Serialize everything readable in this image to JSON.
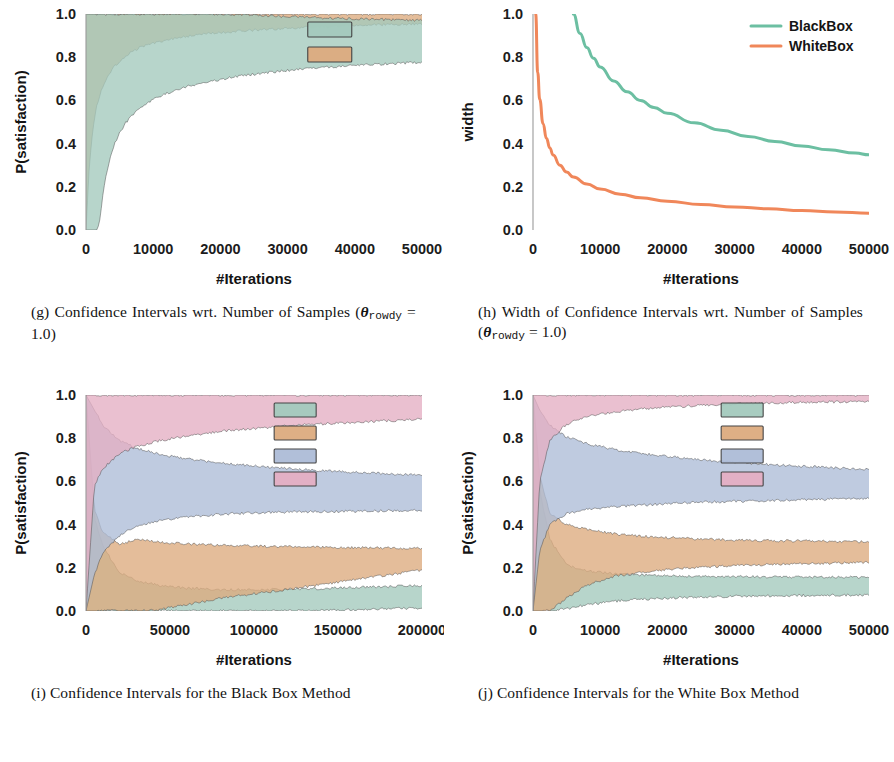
{
  "figure": {
    "panels": [
      {
        "key": "g",
        "tag": "(g)",
        "caption_line1": "Confidence Intervals wrt. Number of",
        "caption_line2_pre": "Samples (",
        "caption_theta": "θ",
        "caption_sub": "rowdy",
        "caption_line2_post": " = 1.0)",
        "chart_ref": 0
      },
      {
        "key": "h",
        "tag": "(h)",
        "caption_line1": "Width of Confidence Intervals wrt.",
        "caption_line2_pre": "Number of Samples (",
        "caption_theta": "θ",
        "caption_sub": "rowdy",
        "caption_line2_post": " = 1.0)",
        "chart_ref": 1
      },
      {
        "key": "i",
        "tag": "(i)",
        "caption_line1": "Confidence Intervals for the Black",
        "caption_line2_pre": "Box Method",
        "caption_theta": "",
        "caption_sub": "",
        "caption_line2_post": "",
        "chart_ref": 2
      },
      {
        "key": "j",
        "tag": "(j)",
        "caption_line1": "Confidence Intervals for the White",
        "caption_line2_pre": "Box Method",
        "caption_theta": "",
        "caption_sub": "",
        "caption_line2_post": "",
        "chart_ref": 3
      }
    ]
  },
  "colors": {
    "green_band": "#a3c9bd",
    "orange_band": "#dcab7e",
    "blue_band": "#adbcd7",
    "pink_band": "#e4aec3",
    "green_line": "#6cbfa2",
    "orange_line": "#f0875a",
    "edge": "#4d4d4d",
    "spine": "#9a9a9a",
    "text": "#1a1a1a"
  },
  "chart_data": [
    {
      "type": "area",
      "title": "",
      "xlabel": "#Iterations",
      "ylabel": "P(satisfaction)",
      "xlim": [
        0,
        50000
      ],
      "ylim": [
        0.0,
        1.0
      ],
      "xticks": [
        0,
        10000,
        20000,
        30000,
        40000,
        50000
      ],
      "xticklabels": [
        "0",
        "10000",
        "20000",
        "30000",
        "40000",
        "50000"
      ],
      "yticks": [
        0.0,
        0.2,
        0.4,
        0.6,
        0.8,
        1.0
      ],
      "yticklabels": [
        "0.0",
        "0.2",
        "0.4",
        "0.6",
        "0.8",
        "1.0"
      ],
      "grid": false,
      "legend_position": "upper-right-inside",
      "legend_entries": [
        {
          "label": "",
          "color": "#a3c9bd",
          "swatch": "box"
        },
        {
          "label": "",
          "color": "#dcab7e",
          "swatch": "box"
        }
      ],
      "series": [
        {
          "name": "WhiteBox interval",
          "color": "#dcab7e",
          "x": [
            0,
            500,
            1000,
            1500,
            2000,
            3000,
            4000,
            6000,
            8000,
            10000,
            14000,
            18000,
            22000,
            26000,
            30000,
            35000,
            40000,
            45000,
            50000
          ],
          "lower": [
            0.0,
            0.3,
            0.46,
            0.56,
            0.62,
            0.7,
            0.75,
            0.81,
            0.845,
            0.865,
            0.893,
            0.908,
            0.919,
            0.927,
            0.934,
            0.941,
            0.947,
            0.951,
            0.955
          ],
          "upper": [
            1.0,
            1.0,
            1.0,
            1.0,
            1.0,
            1.0,
            1.0,
            1.0,
            1.0,
            1.0,
            1.0,
            1.0,
            1.0,
            1.0,
            1.0,
            1.0,
            1.0,
            1.0,
            1.0
          ]
        },
        {
          "name": "BlackBox interval",
          "color": "#a3c9bd",
          "x": [
            0,
            1000,
            1500,
            2000,
            2500,
            3000,
            4000,
            5000,
            6000,
            8000,
            10000,
            13000,
            16000,
            20000,
            25000,
            30000,
            35000,
            40000,
            45000,
            50000
          ],
          "lower": [
            0.0,
            0.0,
            0.0,
            0.03,
            0.16,
            0.26,
            0.38,
            0.45,
            0.5,
            0.565,
            0.605,
            0.645,
            0.672,
            0.697,
            0.722,
            0.739,
            0.752,
            0.761,
            0.77,
            0.777
          ],
          "upper": [
            1.0,
            1.0,
            1.0,
            1.0,
            1.0,
            1.0,
            1.0,
            1.0,
            1.0,
            1.0,
            1.0,
            1.0,
            1.0,
            1.0,
            0.995,
            0.988,
            0.982,
            0.978,
            0.974,
            0.97
          ]
        }
      ]
    },
    {
      "type": "line",
      "title": "",
      "xlabel": "#Iterations",
      "ylabel": "width",
      "xlim": [
        0,
        50000
      ],
      "ylim": [
        0.0,
        1.0
      ],
      "xticks": [
        0,
        10000,
        20000,
        30000,
        40000,
        50000
      ],
      "xticklabels": [
        "0",
        "10000",
        "20000",
        "30000",
        "40000",
        "50000"
      ],
      "yticks": [
        0.0,
        0.2,
        0.4,
        0.6,
        0.8,
        1.0
      ],
      "yticklabels": [
        "0.0",
        "0.2",
        "0.4",
        "0.6",
        "0.8",
        "1.0"
      ],
      "grid": false,
      "legend_position": "upper-right",
      "legend_entries": [
        {
          "label": "BlackBox",
          "color": "#6cbfa2",
          "swatch": "line"
        },
        {
          "label": "WhiteBox",
          "color": "#f0875a",
          "swatch": "line"
        }
      ],
      "series": [
        {
          "name": "BlackBox",
          "color": "#6cbfa2",
          "x": [
            6000,
            7000,
            8000,
            9000,
            10000,
            12000,
            14000,
            16000,
            18000,
            20000,
            24000,
            28000,
            32000,
            36000,
            40000,
            44000,
            48000,
            50000
          ],
          "y": [
            1.0,
            0.91,
            0.845,
            0.795,
            0.755,
            0.69,
            0.64,
            0.6,
            0.567,
            0.54,
            0.496,
            0.462,
            0.433,
            0.41,
            0.389,
            0.371,
            0.356,
            0.348
          ]
        },
        {
          "name": "WhiteBox",
          "color": "#f0875a",
          "x": [
            400,
            700,
            1000,
            1500,
            2000,
            2500,
            3000,
            4000,
            5000,
            6000,
            8000,
            10000,
            13000,
            16000,
            20000,
            25000,
            30000,
            35000,
            40000,
            45000,
            50000
          ],
          "y": [
            1.0,
            0.73,
            0.605,
            0.492,
            0.425,
            0.38,
            0.347,
            0.3,
            0.268,
            0.245,
            0.213,
            0.19,
            0.166,
            0.149,
            0.133,
            0.118,
            0.107,
            0.098,
            0.09,
            0.083,
            0.078
          ]
        }
      ]
    },
    {
      "type": "area",
      "title": "",
      "xlabel": "#Iterations",
      "ylabel": "P(satisfaction)",
      "xlim": [
        0,
        200000
      ],
      "ylim": [
        0.0,
        1.0
      ],
      "xticks": [
        0,
        50000,
        100000,
        150000,
        200000
      ],
      "xticklabels": [
        "0",
        "50000",
        "100000",
        "150000",
        "200000"
      ],
      "yticks": [
        0.0,
        0.2,
        0.4,
        0.6,
        0.8,
        1.0
      ],
      "yticklabels": [
        "0.0",
        "0.2",
        "0.4",
        "0.6",
        "0.8",
        "1.0"
      ],
      "grid": false,
      "legend_position": "upper-center",
      "legend_entries": [
        {
          "label": "",
          "color": "#a3c9bd",
          "swatch": "box"
        },
        {
          "label": "",
          "color": "#dcab7e",
          "swatch": "box"
        },
        {
          "label": "",
          "color": "#adbcd7",
          "swatch": "box"
        },
        {
          "label": "",
          "color": "#e4aec3",
          "swatch": "box"
        }
      ],
      "series": [
        {
          "name": "interval-green",
          "color": "#a3c9bd",
          "x": [
            0,
            5000,
            10000,
            20000,
            30000,
            45000,
            60000,
            80000,
            100000,
            120000,
            140000,
            160000,
            180000,
            200000
          ],
          "lower": [
            0.0,
            0.0,
            0.0,
            0.0,
            0.0,
            0.0,
            0.0,
            0.0,
            0.0,
            0.0,
            0.002,
            0.005,
            0.01,
            0.015
          ],
          "upper": [
            1.0,
            0.43,
            0.3,
            0.18,
            0.14,
            0.118,
            0.106,
            0.098,
            0.098,
            0.1,
            0.104,
            0.109,
            0.113,
            0.118
          ]
        },
        {
          "name": "interval-orange",
          "color": "#dcab7e",
          "x": [
            0,
            5000,
            10000,
            20000,
            30000,
            45000,
            60000,
            80000,
            100000,
            120000,
            140000,
            160000,
            180000,
            200000
          ],
          "lower": [
            0.0,
            0.0,
            0.0,
            0.0,
            0.0,
            0.008,
            0.03,
            0.058,
            0.08,
            0.1,
            0.122,
            0.145,
            0.168,
            0.19
          ],
          "upper": [
            1.0,
            0.47,
            0.365,
            0.31,
            0.33,
            0.318,
            0.31,
            0.305,
            0.3,
            0.298,
            0.295,
            0.293,
            0.292,
            0.29
          ]
        },
        {
          "name": "interval-blue",
          "color": "#adbcd7",
          "x": [
            0,
            5000,
            10000,
            20000,
            30000,
            45000,
            60000,
            80000,
            100000,
            120000,
            140000,
            160000,
            180000,
            200000
          ],
          "lower": [
            0.0,
            0.17,
            0.27,
            0.35,
            0.395,
            0.42,
            0.435,
            0.448,
            0.455,
            0.458,
            0.46,
            0.462,
            0.464,
            0.465
          ],
          "upper": [
            1.0,
            0.93,
            0.86,
            0.79,
            0.752,
            0.725,
            0.705,
            0.685,
            0.672,
            0.66,
            0.65,
            0.642,
            0.635,
            0.628
          ]
        },
        {
          "name": "interval-pink",
          "color": "#e4aec3",
          "x": [
            0,
            5000,
            10000,
            20000,
            30000,
            45000,
            60000,
            80000,
            100000,
            120000,
            140000,
            160000,
            180000,
            200000
          ],
          "lower": [
            0.0,
            0.58,
            0.66,
            0.728,
            0.762,
            0.79,
            0.81,
            0.832,
            0.845,
            0.857,
            0.866,
            0.874,
            0.881,
            0.888
          ],
          "upper": [
            1.0,
            1.0,
            1.0,
            1.0,
            1.0,
            1.0,
            1.0,
            1.0,
            1.0,
            1.0,
            1.0,
            1.0,
            1.0,
            1.0
          ]
        }
      ]
    },
    {
      "type": "area",
      "title": "",
      "xlabel": "#Iterations",
      "ylabel": "P(satisfaction)",
      "xlim": [
        0,
        50000
      ],
      "ylim": [
        0.0,
        1.0
      ],
      "xticks": [
        0,
        10000,
        20000,
        30000,
        40000,
        50000
      ],
      "xticklabels": [
        "0",
        "10000",
        "20000",
        "30000",
        "40000",
        "50000"
      ],
      "yticks": [
        0.0,
        0.2,
        0.4,
        0.6,
        0.8,
        1.0
      ],
      "yticklabels": [
        "0.0",
        "0.2",
        "0.4",
        "0.6",
        "0.8",
        "1.0"
      ],
      "grid": false,
      "legend_position": "upper-center",
      "legend_entries": [
        {
          "label": "",
          "color": "#a3c9bd",
          "swatch": "box"
        },
        {
          "label": "",
          "color": "#dcab7e",
          "swatch": "box"
        },
        {
          "label": "",
          "color": "#adbcd7",
          "swatch": "box"
        },
        {
          "label": "",
          "color": "#e4aec3",
          "swatch": "box"
        }
      ],
      "series": [
        {
          "name": "interval-green",
          "color": "#a3c9bd",
          "x": [
            0,
            1000,
            2500,
            5000,
            8000,
            12000,
            16000,
            20000,
            25000,
            30000,
            35000,
            40000,
            45000,
            50000
          ],
          "lower": [
            0.0,
            0.0,
            0.0,
            0.01,
            0.03,
            0.045,
            0.055,
            0.06,
            0.065,
            0.068,
            0.07,
            0.072,
            0.074,
            0.075
          ],
          "upper": [
            1.0,
            0.56,
            0.33,
            0.215,
            0.185,
            0.172,
            0.167,
            0.163,
            0.16,
            0.159,
            0.158,
            0.157,
            0.157,
            0.156
          ]
        },
        {
          "name": "interval-orange",
          "color": "#dcab7e",
          "x": [
            0,
            1000,
            2500,
            5000,
            8000,
            12000,
            16000,
            20000,
            25000,
            30000,
            35000,
            40000,
            45000,
            50000
          ],
          "lower": [
            0.0,
            0.0,
            0.0,
            0.06,
            0.12,
            0.16,
            0.18,
            0.192,
            0.203,
            0.21,
            0.215,
            0.219,
            0.222,
            0.225
          ],
          "upper": [
            1.0,
            0.63,
            0.45,
            0.4,
            0.378,
            0.358,
            0.346,
            0.34,
            0.333,
            0.329,
            0.326,
            0.324,
            0.322,
            0.32
          ]
        },
        {
          "name": "interval-blue",
          "color": "#adbcd7",
          "x": [
            0,
            1000,
            2500,
            5000,
            8000,
            12000,
            16000,
            20000,
            25000,
            30000,
            35000,
            40000,
            45000,
            50000
          ],
          "lower": [
            0.0,
            0.28,
            0.4,
            0.45,
            0.47,
            0.482,
            0.49,
            0.497,
            0.503,
            0.508,
            0.512,
            0.515,
            0.518,
            0.52
          ],
          "upper": [
            1.0,
            0.93,
            0.86,
            0.805,
            0.775,
            0.748,
            0.73,
            0.716,
            0.7,
            0.688,
            0.678,
            0.67,
            0.662,
            0.655
          ]
        },
        {
          "name": "interval-pink",
          "color": "#e4aec3",
          "x": [
            0,
            1000,
            2500,
            5000,
            8000,
            12000,
            16000,
            20000,
            25000,
            30000,
            35000,
            40000,
            45000,
            50000
          ],
          "lower": [
            0.0,
            0.6,
            0.79,
            0.865,
            0.9,
            0.922,
            0.935,
            0.944,
            0.952,
            0.958,
            0.962,
            0.966,
            0.968,
            0.971
          ],
          "upper": [
            1.0,
            1.0,
            1.0,
            1.0,
            1.0,
            1.0,
            1.0,
            1.0,
            1.0,
            1.0,
            1.0,
            1.0,
            1.0,
            1.0
          ]
        }
      ]
    }
  ]
}
